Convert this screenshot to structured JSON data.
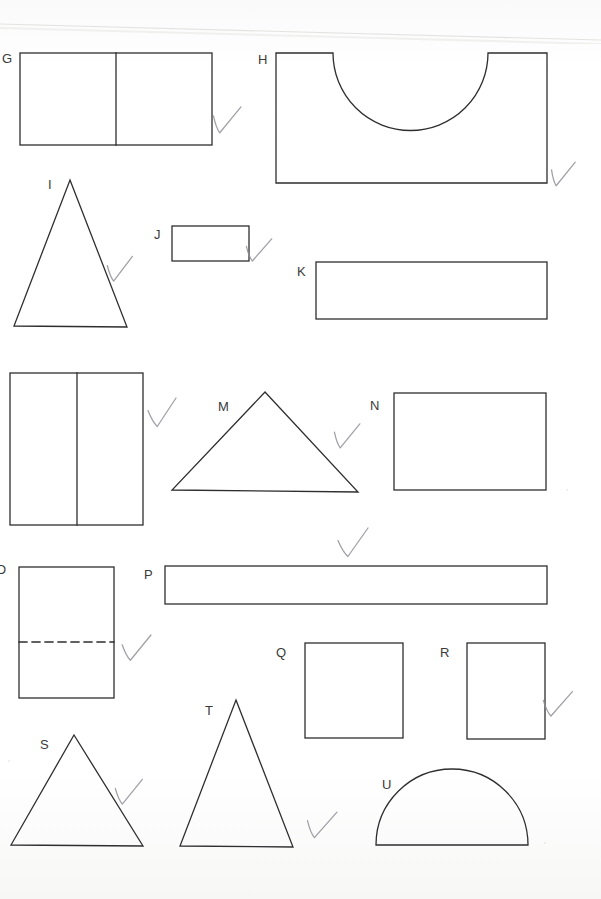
{
  "page": {
    "width": 601,
    "height": 899,
    "background_color": "#fdfdfc",
    "ink_color": "#2e2e2e",
    "check_color": "#8e8e96",
    "document_type": "scanned geometry shapes worksheet",
    "title": ""
  },
  "shapes": [
    {
      "id": "G",
      "label": "G",
      "label_pos": {
        "x": 2,
        "y": 52
      },
      "type": "rectangle-divided-vertical",
      "rect": {
        "x": 20,
        "y": 53,
        "w": 192,
        "h": 92
      },
      "divider_x": 116,
      "checked": true,
      "check": {
        "x": 213,
        "y": 105,
        "w": 26,
        "h": 30,
        "rotate": 8
      }
    },
    {
      "id": "H",
      "label": "H",
      "label_pos": {
        "x": 258,
        "y": 53
      },
      "type": "rectangle-with-semicircular-notch-top",
      "rect": {
        "x": 276,
        "y": 53,
        "w": 271,
        "h": 130
      },
      "notch": {
        "x1": 333,
        "x2": 488,
        "depth": 78
      },
      "checked": true,
      "check": {
        "x": 551,
        "y": 160,
        "w": 22,
        "h": 28,
        "rotate": 10
      }
    },
    {
      "id": "I",
      "label": "I",
      "label_pos": {
        "x": 48,
        "y": 178
      },
      "type": "triangle-isosceles-tall",
      "apex": {
        "x": 70,
        "y": 180
      },
      "base_left": {
        "x": 14,
        "y": 326
      },
      "base_right": {
        "x": 127,
        "y": 327
      },
      "checked": true,
      "check": {
        "x": 107,
        "y": 255,
        "w": 24,
        "h": 28,
        "rotate": 6
      }
    },
    {
      "id": "J",
      "label": "J",
      "label_pos": {
        "x": 154,
        "y": 228
      },
      "type": "rectangle",
      "rect": {
        "x": 172,
        "y": 226,
        "w": 77,
        "h": 35
      },
      "checked": true,
      "check": {
        "x": 246,
        "y": 237,
        "w": 24,
        "h": 26,
        "rotate": 8
      }
    },
    {
      "id": "K",
      "label": "K",
      "label_pos": {
        "x": 297,
        "y": 265
      },
      "type": "rectangle-long",
      "rect": {
        "x": 316,
        "y": 262,
        "w": 231,
        "h": 57
      },
      "checked": false,
      "check": null
    },
    {
      "id": "L",
      "label": "",
      "label_pos": {
        "x": 0,
        "y": 392
      },
      "type": "rectangle-divided-vertical",
      "rect": {
        "x": 10,
        "y": 373,
        "w": 133,
        "h": 152
      },
      "divider_x": 77,
      "checked": true,
      "check": {
        "x": 148,
        "y": 398,
        "w": 28,
        "h": 30,
        "rotate": 0
      }
    },
    {
      "id": "M",
      "label": "M",
      "label_pos": {
        "x": 218,
        "y": 400
      },
      "type": "triangle-isosceles-wide",
      "apex": {
        "x": 265,
        "y": 392
      },
      "base_left": {
        "x": 172,
        "y": 490
      },
      "base_right": {
        "x": 358,
        "y": 492
      },
      "checked": true,
      "check": {
        "x": 334,
        "y": 422,
        "w": 24,
        "h": 28,
        "rotate": 8
      }
    },
    {
      "id": "N",
      "label": "N",
      "label_pos": {
        "x": 370,
        "y": 399
      },
      "type": "rectangle",
      "rect": {
        "x": 394,
        "y": 393,
        "w": 152,
        "h": 97
      },
      "checked": false,
      "check": null
    },
    {
      "id": "O",
      "label": "O",
      "label_pos": {
        "x": -4,
        "y": 563
      },
      "type": "rectangle-with-dashed-horizontal-line",
      "rect": {
        "x": 19,
        "y": 567,
        "w": 95,
        "h": 131
      },
      "dashed_y": 642,
      "checked": true,
      "check": {
        "x": 122,
        "y": 634,
        "w": 28,
        "h": 28,
        "rotate": 4
      }
    },
    {
      "id": "P",
      "label": "P",
      "label_pos": {
        "x": 144,
        "y": 568
      },
      "type": "rectangle-long-thin",
      "rect": {
        "x": 165,
        "y": 566,
        "w": 382,
        "h": 38
      },
      "checked": true,
      "check": {
        "x": 338,
        "y": 528,
        "w": 30,
        "h": 30,
        "rotate": 0
      }
    },
    {
      "id": "Q",
      "label": "Q",
      "label_pos": {
        "x": 276,
        "y": 646
      },
      "type": "square",
      "rect": {
        "x": 305,
        "y": 643,
        "w": 98,
        "h": 95
      },
      "checked": false,
      "check": null
    },
    {
      "id": "R",
      "label": "R",
      "label_pos": {
        "x": 440,
        "y": 646
      },
      "type": "square",
      "rect": {
        "x": 467,
        "y": 643,
        "w": 78,
        "h": 96
      },
      "checked": true,
      "check": {
        "x": 543,
        "y": 690,
        "w": 28,
        "h": 28,
        "rotate": 6
      }
    },
    {
      "id": "S",
      "label": "S",
      "label_pos": {
        "x": 40,
        "y": 738
      },
      "type": "triangle-isosceles",
      "apex": {
        "x": 74,
        "y": 735
      },
      "base_left": {
        "x": 11,
        "y": 845
      },
      "base_right": {
        "x": 143,
        "y": 846
      },
      "checked": true,
      "check": {
        "x": 115,
        "y": 778,
        "w": 26,
        "h": 28,
        "rotate": 6
      }
    },
    {
      "id": "T",
      "label": "T",
      "label_pos": {
        "x": 205,
        "y": 704
      },
      "type": "triangle-isosceles-tall",
      "apex": {
        "x": 236,
        "y": 700
      },
      "base_left": {
        "x": 180,
        "y": 846
      },
      "base_right": {
        "x": 293,
        "y": 847
      },
      "checked": true,
      "check": {
        "x": 307,
        "y": 810,
        "w": 28,
        "h": 30,
        "rotate": 8
      }
    },
    {
      "id": "U",
      "label": "U",
      "label_pos": {
        "x": 382,
        "y": 778
      },
      "type": "semicircle",
      "base_left": {
        "x": 376,
        "y": 845
      },
      "base_right": {
        "x": 528,
        "y": 845
      },
      "radius": 76,
      "checked": false,
      "check": null
    }
  ],
  "marks": {
    "check_count": 10,
    "checked_ids": [
      "G",
      "H",
      "I",
      "J",
      "L",
      "M",
      "O",
      "P",
      "R",
      "S",
      "T"
    ]
  }
}
